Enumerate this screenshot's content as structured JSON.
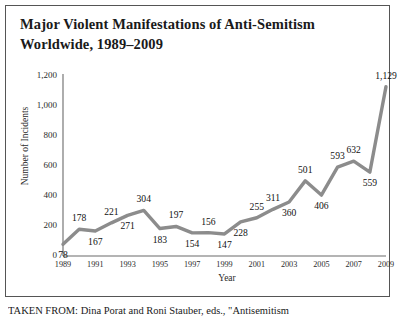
{
  "figure": {
    "title": "Major Violent Manifestations of Anti-Semitism Worldwide, 1989–2009",
    "caption": "TAKEN FROM: Dina Porat and Roni Stauber, eds., \"Antisemitism"
  },
  "chart_data": {
    "type": "line",
    "title": "Major Violent Manifestations of Anti-Semitism Worldwide, 1989–2009",
    "xlabel": "Year",
    "ylabel": "Number of Incidents",
    "x": [
      1989,
      1990,
      1991,
      1992,
      1993,
      1994,
      1995,
      1996,
      1997,
      1998,
      1999,
      2000,
      2001,
      2002,
      2003,
      2004,
      2005,
      2006,
      2007,
      2008,
      2009
    ],
    "values": [
      78,
      178,
      167,
      221,
      271,
      304,
      183,
      197,
      154,
      156,
      147,
      228,
      255,
      311,
      360,
      501,
      406,
      593,
      632,
      559,
      1129
    ],
    "point_labels": [
      "78",
      "178",
      "167",
      "221",
      "271",
      "304",
      "183",
      "197",
      "154",
      "156",
      "147",
      "228",
      "255",
      "311",
      "360",
      "501",
      "406",
      "593",
      "632",
      "559",
      "1,129"
    ],
    "label_positions": [
      "below",
      "above",
      "below",
      "above",
      "below",
      "above",
      "below",
      "above",
      "below",
      "above",
      "below",
      "below",
      "above",
      "above",
      "below",
      "above",
      "below",
      "above",
      "above",
      "below",
      "above"
    ],
    "ylim": [
      0,
      1200
    ],
    "yticks": [
      0,
      200,
      400,
      600,
      800,
      1000,
      1200
    ],
    "ytick_labels": [
      "0",
      "200",
      "400",
      "600",
      "800",
      "1,000",
      "1,200"
    ],
    "xticks": [
      1989,
      1991,
      1993,
      1995,
      1997,
      1999,
      2001,
      2003,
      2005,
      2007,
      2009
    ],
    "xtick_labels": [
      "1989",
      "1991",
      "1993",
      "1995",
      "1997",
      "1999",
      "2001",
      "2003",
      "2005",
      "2007",
      "2009"
    ],
    "grid": false,
    "legend": false,
    "line_color": "#8c8c8c",
    "line_width": 3.4
  }
}
